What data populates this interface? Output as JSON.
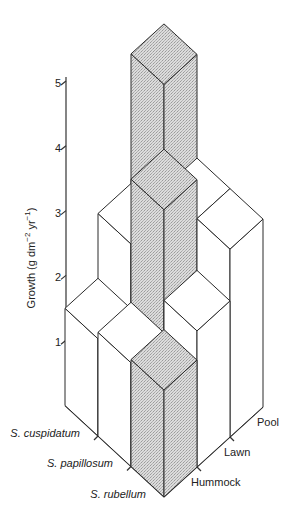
{
  "chart_data": {
    "type": "bar3d",
    "title": "",
    "ylabel": "Growth (g dm⁻² yr⁻¹)",
    "ylabel_parts": {
      "base": "Growth (g dm",
      "exp1": "−2",
      "mid": " yr",
      "exp2": "−1",
      "end": ")"
    },
    "ylim": [
      0,
      5
    ],
    "yticks": [
      1,
      2,
      3,
      4,
      5
    ],
    "grid": false,
    "legend": null,
    "species_axis": [
      "S. cuspidatum",
      "S. papillosum",
      "S. rubellum"
    ],
    "habitat_axis": [
      "Hummock",
      "Lawn",
      "Pool"
    ],
    "series": [
      {
        "name": "S. cuspidatum",
        "values": [
          1.5,
          2.5,
          4.5
        ]
      },
      {
        "name": "S. papillosum",
        "values": [
          1.6,
          3.5,
          2.9
        ]
      },
      {
        "name": "S. rubellum",
        "values": [
          1.65,
          2.1,
          2.9
        ]
      }
    ],
    "highlighted_cells": [
      {
        "species": "S. cuspidatum",
        "habitat": "Pool"
      },
      {
        "species": "S. papillosum",
        "habitat": "Lawn"
      },
      {
        "species": "S. rubellum",
        "habitat": "Hummock"
      }
    ],
    "colors": {
      "highlight_fill": "#d4d4d4",
      "plain_fill": "#ffffff",
      "edge": "#2a2a2a"
    }
  }
}
